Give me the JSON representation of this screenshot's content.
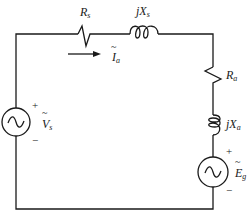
{
  "diagram": {
    "type": "circuit",
    "components": {
      "source_voltage": {
        "symbol": "V",
        "subscript": "s",
        "plus": "+",
        "minus": "−"
      },
      "series_resistance": {
        "symbol": "R",
        "subscript": "s"
      },
      "series_reactance": {
        "prefix": "jX",
        "subscript": "s"
      },
      "current": {
        "symbol": "I",
        "subscript": "a"
      },
      "armature_resistance": {
        "symbol": "R",
        "subscript": "a"
      },
      "armature_reactance": {
        "prefix": "jX",
        "subscript": "a"
      },
      "generator_emf": {
        "symbol": "E",
        "subscript": "g",
        "plus": "+",
        "minus": "−"
      }
    },
    "tilde": "~",
    "colors": {
      "line": "#1a1a1a",
      "background": "#ffffff"
    }
  }
}
